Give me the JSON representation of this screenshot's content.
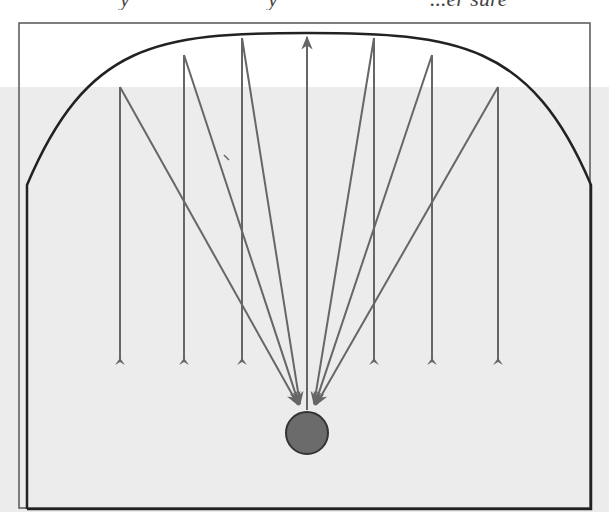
{
  "page": {
    "cropped_header_fragments": [
      "y",
      "y",
      "...er sure"
    ]
  },
  "diagram": {
    "colors": {
      "background_top": "#ffffff",
      "background_band": "#ececec",
      "frame": "#555555",
      "wall": "#222222",
      "ray": "#666666",
      "ball_fill": "#6b6b6b",
      "ball_stroke": "#333333"
    },
    "outer_frame": {
      "x": 19,
      "y": 23,
      "w": 571,
      "h": 485
    },
    "reflector": {
      "left_wall_x": 27,
      "right_wall_x": 591,
      "wall_top_y": 185,
      "bottom_y": 509,
      "apex": {
        "x": 307,
        "y": 33
      }
    },
    "focus": {
      "x": 307,
      "y": 410
    },
    "ball": {
      "cx": 307,
      "cy": 433,
      "r": 21
    },
    "rays": [
      {
        "x": 120,
        "tail_y": 362,
        "hit_y": 87
      },
      {
        "x": 184,
        "tail_y": 362,
        "hit_y": 55
      },
      {
        "x": 242,
        "tail_y": 362,
        "hit_y": 38
      },
      {
        "x": 374,
        "tail_y": 362,
        "hit_y": 38
      },
      {
        "x": 432,
        "tail_y": 362,
        "hit_y": 55
      },
      {
        "x": 498,
        "tail_y": 362,
        "hit_y": 87
      }
    ],
    "central_ray": {
      "x": 307,
      "from_y": 410,
      "to_y": 37
    }
  }
}
